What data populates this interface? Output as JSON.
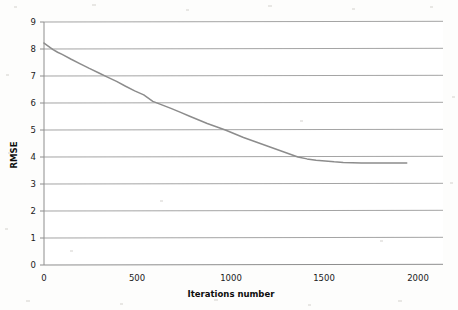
{
  "chart_data": {
    "type": "line",
    "title": "",
    "subtitle": "",
    "xlabel": "Iterations number",
    "ylabel": "RMSE",
    "xlim": [
      0,
      2200
    ],
    "ylim": [
      0,
      9
    ],
    "grid": "horizontal",
    "legend": "none",
    "x_ticks": [
      0,
      500,
      1000,
      1500,
      2000
    ],
    "x_tick_labels": [
      "0",
      "500",
      "1000",
      "1500",
      "2000"
    ],
    "y_ticks": [
      0,
      1,
      2,
      3,
      4,
      5,
      6,
      7,
      8,
      9
    ],
    "y_tick_labels": [
      "0",
      "1",
      "2",
      "3",
      "4",
      "5",
      "6",
      "7",
      "8",
      "9"
    ],
    "line_color": "#8c8c8c",
    "grid_color": "#9a9a9a",
    "axis_color": "#8e8e8e",
    "series": [
      {
        "name": "RMSE",
        "x": [
          0,
          25,
          50,
          75,
          100,
          150,
          200,
          250,
          300,
          350,
          400,
          450,
          500,
          550,
          600,
          650,
          700,
          750,
          800,
          850,
          900,
          950,
          1000,
          1050,
          1100,
          1150,
          1200,
          1250,
          1300,
          1350,
          1400,
          1450,
          1500,
          1550,
          1600,
          1650,
          1700,
          1750,
          1800,
          1850,
          1900,
          1950,
          2000
        ],
        "values": [
          8.22,
          8.1,
          7.98,
          7.88,
          7.8,
          7.62,
          7.45,
          7.28,
          7.12,
          6.96,
          6.8,
          6.62,
          6.45,
          6.3,
          6.06,
          5.93,
          5.8,
          5.66,
          5.52,
          5.38,
          5.24,
          5.12,
          5.0,
          4.86,
          4.72,
          4.6,
          4.48,
          4.36,
          4.24,
          4.12,
          4.0,
          3.93,
          3.88,
          3.85,
          3.82,
          3.8,
          3.79,
          3.78,
          3.78,
          3.78,
          3.78,
          3.78,
          3.78
        ]
      }
    ],
    "annotations": {
      "start_value": "8.22",
      "final_value": "3.78",
      "plateau_start_iteration": "1500"
    }
  },
  "axes": {
    "y_title": "RMSE",
    "x_title": "Iterations number"
  }
}
